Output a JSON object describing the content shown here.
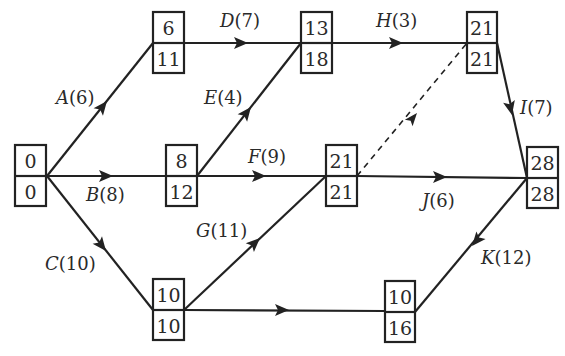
{
  "diagram": {
    "type": "activity-on-arrow network (critical path)",
    "nodes": [
      {
        "id": "n0",
        "top": "0",
        "bottom": "0",
        "x": 15,
        "y": 145
      },
      {
        "id": "n1",
        "top": "6",
        "bottom": "11",
        "x": 153,
        "y": 12
      },
      {
        "id": "n2",
        "top": "8",
        "bottom": "12",
        "x": 166,
        "y": 145
      },
      {
        "id": "n3",
        "top": "13",
        "bottom": "18",
        "x": 301,
        "y": 12
      },
      {
        "id": "n4",
        "top": "21",
        "bottom": "21",
        "x": 467,
        "y": 12
      },
      {
        "id": "n5",
        "top": "10",
        "bottom": "10",
        "x": 153,
        "y": 279
      },
      {
        "id": "n6",
        "top": "21",
        "bottom": "21",
        "x": 326,
        "y": 145
      },
      {
        "id": "n7",
        "top": "28",
        "bottom": "28",
        "x": 527,
        "y": 147
      },
      {
        "id": "n8",
        "top": "10",
        "bottom": "16",
        "x": 385,
        "y": 281
      }
    ],
    "edges": [
      {
        "id": "A",
        "label": "A(6)",
        "from": "n0",
        "to": "n1"
      },
      {
        "id": "B",
        "label": "B(8)",
        "from": "n0",
        "to": "n2"
      },
      {
        "id": "C",
        "label": "C(10)",
        "from": "n0",
        "to": "n5"
      },
      {
        "id": "D",
        "label": "D(7)",
        "from": "n1",
        "to": "n3"
      },
      {
        "id": "E",
        "label": "E(4)",
        "from": "n2",
        "to": "n3"
      },
      {
        "id": "F",
        "label": "F(9)",
        "from": "n2",
        "to": "n6"
      },
      {
        "id": "G",
        "label": "G(11)",
        "from": "n5",
        "to": "n6"
      },
      {
        "id": "H",
        "label": "H(3)",
        "from": "n3",
        "to": "n4"
      },
      {
        "id": "I",
        "label": "I(7)",
        "from": "n4",
        "to": "n7"
      },
      {
        "id": "J",
        "label": "J(6)",
        "from": "n6",
        "to": "n7"
      },
      {
        "id": "K",
        "label": "K(12)",
        "from": "n7",
        "to": "n8",
        "arrow_as_drawn": "points toward n8"
      },
      {
        "id": "n5-n8",
        "label": "",
        "from": "n5",
        "to": "n8"
      },
      {
        "id": "dummy",
        "label": "",
        "from": "n6",
        "to": "n4",
        "style": "dashed"
      }
    ]
  },
  "labels": {
    "A": {
      "name": "A",
      "dur": "(6)"
    },
    "B": {
      "name": "B",
      "dur": "(8)"
    },
    "C": {
      "name": "C",
      "dur": "(10)"
    },
    "D": {
      "name": "D",
      "dur": "(7)"
    },
    "E": {
      "name": "E",
      "dur": "(4)"
    },
    "F": {
      "name": "F",
      "dur": "(9)"
    },
    "G": {
      "name": "G",
      "dur": "(11)"
    },
    "H": {
      "name": "H",
      "dur": "(3)"
    },
    "I": {
      "name": "I",
      "dur": "(7)"
    },
    "J": {
      "name": "J",
      "dur": "(6)"
    },
    "K": {
      "name": "K",
      "dur": "(12)"
    }
  },
  "node_values": {
    "n0": {
      "top": "0",
      "bottom": "0"
    },
    "n1": {
      "top": "6",
      "bottom": "11"
    },
    "n2": {
      "top": "8",
      "bottom": "12"
    },
    "n3": {
      "top": "13",
      "bottom": "18"
    },
    "n4": {
      "top": "21",
      "bottom": "21"
    },
    "n5": {
      "top": "10",
      "bottom": "10"
    },
    "n6": {
      "top": "21",
      "bottom": "21"
    },
    "n7": {
      "top": "28",
      "bottom": "28"
    },
    "n8": {
      "top": "10",
      "bottom": "16"
    }
  },
  "colors": {
    "line": "#222222",
    "text": "#2a2a2a",
    "background": "#ffffff"
  }
}
